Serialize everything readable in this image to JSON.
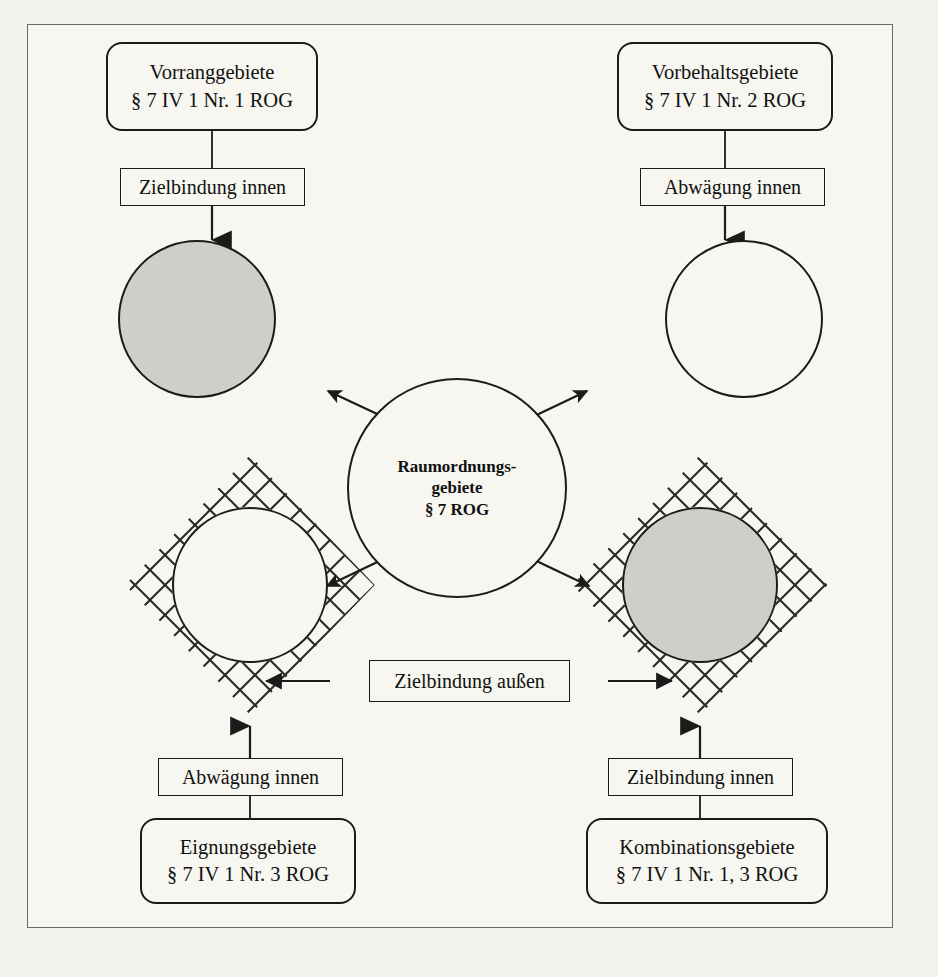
{
  "diagram": {
    "title_center": {
      "line1": "Raumordnungs-",
      "line2": "gebiete",
      "line3": "§ 7 ROG"
    },
    "categories": [
      {
        "id": "vorranggebiete",
        "name_line": "Vorranggebiete",
        "ref_line": "§ 7 IV 1 Nr. 1 ROG",
        "position": "top-left",
        "relation_label": "Zielbindung innen",
        "circle_fill": "#cfcfc9",
        "circle_hatched": false
      },
      {
        "id": "vorbehaltsgebiete",
        "name_line": "Vorbehaltsgebiete",
        "ref_line": "§ 7 IV 1 Nr. 2 ROG",
        "position": "top-right",
        "relation_label": "Abwägung innen",
        "circle_fill": "#f7f6f0",
        "circle_hatched": false
      },
      {
        "id": "eignungsgebiete",
        "name_line": "Eignungsgebiete",
        "ref_line": "§ 7 IV 1 Nr. 3 ROG",
        "position": "bottom-left",
        "relation_label": "Abwägung innen",
        "circle_fill": "#f7f6f0",
        "circle_hatched": true
      },
      {
        "id": "kombinationsgebiete",
        "name_line": "Kombinationsgebiete",
        "ref_line": "§ 7 IV 1 Nr. 1, 3 ROG",
        "position": "bottom-right",
        "relation_label": "Zielbindung innen",
        "circle_fill": "#cfcfc9",
        "circle_hatched": true
      }
    ],
    "outer_relation_label": "Zielbindung außen",
    "colors": {
      "ink": "#1b1b1b",
      "paper": "#f7f6f0",
      "page": "#f3f2ec",
      "fill_gray": "#cfcfc9",
      "frame": "#6b6b63"
    }
  }
}
